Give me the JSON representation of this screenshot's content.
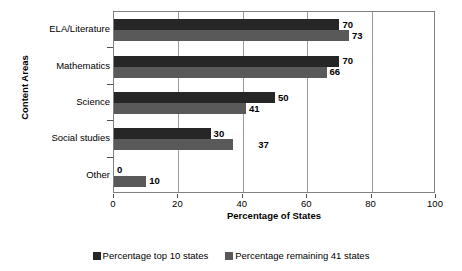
{
  "chart_data": {
    "type": "bar",
    "orientation": "horizontal",
    "title": "",
    "xlabel": "Percentage of States",
    "ylabel": "Content Areas",
    "xlim": [
      0,
      100
    ],
    "xticks": [
      0,
      20,
      40,
      60,
      80,
      100
    ],
    "grid": true,
    "legend_position": "bottom",
    "categories": [
      "ELA/Literature",
      "Mathematics",
      "Science",
      "Social studies",
      "Other"
    ],
    "series": [
      {
        "name": "Percentage top 10 states",
        "color": "#262626",
        "values": [
          70,
          70,
          50,
          30,
          0
        ],
        "labels": [
          "70",
          "70",
          "50",
          "30",
          "0"
        ]
      },
      {
        "name": "Percentage remaining 41 states",
        "color": "#595959",
        "values": [
          73,
          66,
          41,
          37,
          10
        ],
        "labels": [
          "73",
          "66",
          "41",
          "37",
          "10"
        ]
      }
    ]
  }
}
